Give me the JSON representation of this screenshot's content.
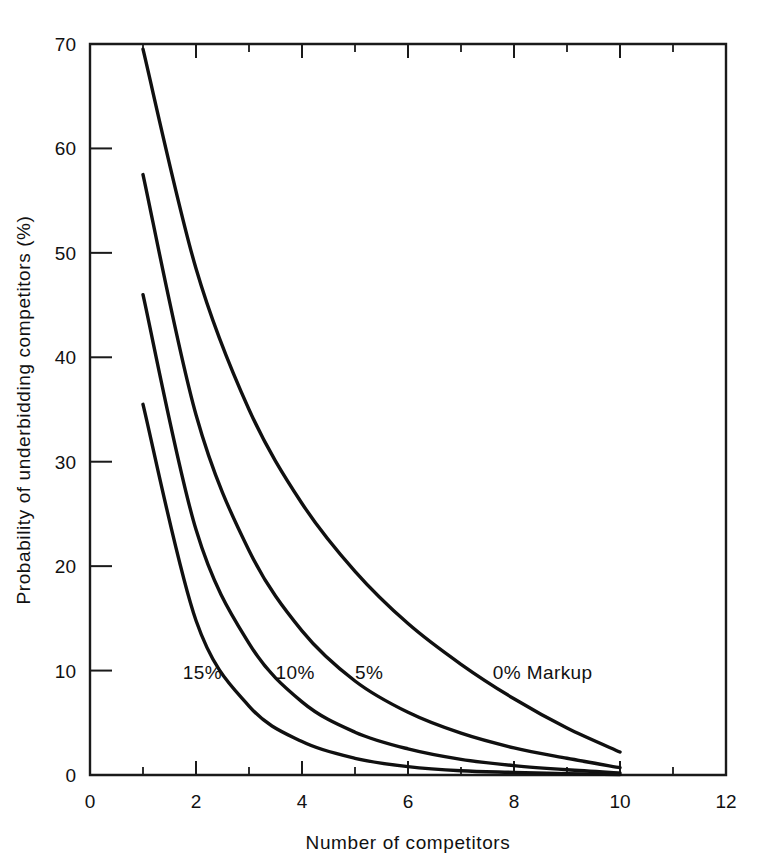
{
  "chart_data": {
    "type": "line",
    "title": "",
    "xlabel": "Number of competitors",
    "ylabel": "Probability of underbidding competitors (%)",
    "xlim": [
      0,
      12
    ],
    "ylim": [
      0,
      70
    ],
    "xticks": [
      0,
      2,
      4,
      6,
      8,
      10,
      12
    ],
    "xticklabels": [
      "0",
      "2",
      "4",
      "6",
      "8",
      "10",
      "12"
    ],
    "xminorticks": [
      1,
      3,
      5,
      7,
      9,
      11
    ],
    "yticks": [
      0,
      10,
      20,
      30,
      40,
      50,
      60,
      70
    ],
    "yticklabels": [
      "0",
      "10",
      "20",
      "30",
      "40",
      "50",
      "60",
      "70"
    ],
    "grid": false,
    "legend_position": "inline-annotations",
    "x": [
      1,
      2,
      3,
      4,
      5,
      6,
      7,
      8,
      9,
      10
    ],
    "series": [
      {
        "name": "0% Markup",
        "label": "0% Markup",
        "label_x": 7.6,
        "label_y": 9.2,
        "values": [
          69.5,
          48.5,
          35.0,
          26.0,
          19.5,
          14.5,
          10.6,
          7.3,
          4.5,
          2.2
        ]
      },
      {
        "name": "5%",
        "label": "5%",
        "label_x": 5.0,
        "label_y": 9.2,
        "values": [
          57.5,
          34.5,
          21.5,
          13.8,
          9.0,
          6.0,
          4.0,
          2.6,
          1.6,
          0.7
        ]
      },
      {
        "name": "10%",
        "label": "10%",
        "label_x": 3.5,
        "label_y": 9.2,
        "values": [
          46.0,
          23.5,
          12.6,
          7.0,
          4.1,
          2.5,
          1.5,
          0.9,
          0.5,
          0.2
        ]
      },
      {
        "name": "15%",
        "label": "15%",
        "label_x": 1.75,
        "label_y": 9.2,
        "values": [
          35.5,
          14.8,
          6.6,
          3.2,
          1.6,
          0.8,
          0.4,
          0.25,
          0.12,
          0.05
        ]
      }
    ]
  },
  "style": {
    "line_color": "#101010",
    "axis_color": "#1a1a1a",
    "background": "#ffffff",
    "text_color": "#111111"
  }
}
